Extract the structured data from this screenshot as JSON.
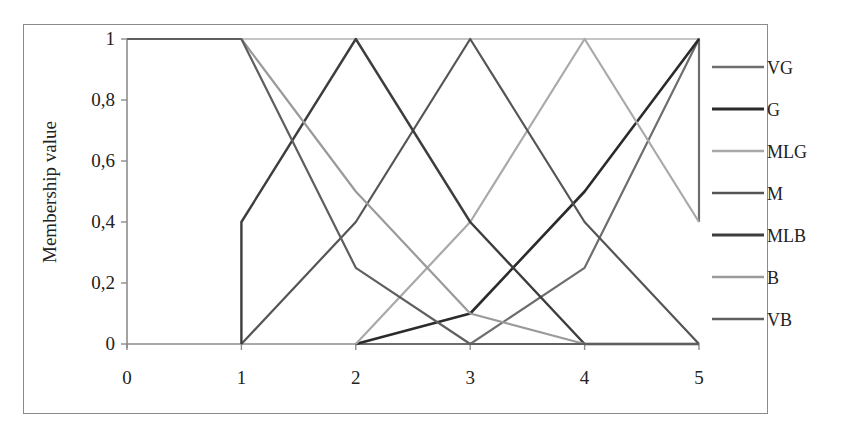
{
  "chart_data": {
    "type": "line",
    "title": "",
    "xlabel": "",
    "ylabel": "Membership value",
    "x": [
      0,
      1,
      2,
      3,
      4,
      5
    ],
    "x_tick_labels": [
      "0",
      "1",
      "2",
      "3",
      "4",
      "5"
    ],
    "y_tick_labels": [
      "0",
      "0,2",
      "0,4",
      "0,6",
      "0,8",
      "1"
    ],
    "xlim": [
      0,
      5
    ],
    "ylim": [
      0,
      1
    ],
    "grid": false,
    "legend_position": "right",
    "series": [
      {
        "name": "VG",
        "color": "#6e6e6e",
        "width": 2.2,
        "points": [
          [
            2,
            0
          ],
          [
            3,
            0
          ],
          [
            4,
            0.25
          ],
          [
            5,
            1
          ],
          [
            5,
            0.4
          ]
        ]
      },
      {
        "name": "G",
        "color": "#2b2b2b",
        "width": 2.6,
        "points": [
          [
            2,
            0
          ],
          [
            3,
            0.1
          ],
          [
            4,
            0.5
          ],
          [
            5,
            1
          ]
        ]
      },
      {
        "name": "MLG",
        "color": "#a9a9a9",
        "width": 2.2,
        "points": [
          [
            2,
            0
          ],
          [
            3,
            0.4
          ],
          [
            4,
            1
          ],
          [
            5,
            0.4
          ]
        ]
      },
      {
        "name": "M",
        "color": "#555555",
        "width": 2.2,
        "points": [
          [
            1,
            0
          ],
          [
            2,
            0.4
          ],
          [
            3,
            1
          ],
          [
            4,
            0.4
          ],
          [
            5,
            0
          ]
        ]
      },
      {
        "name": "MLB",
        "color": "#3d3d3d",
        "width": 2.4,
        "points": [
          [
            1,
            0
          ],
          [
            1,
            0.4
          ],
          [
            2,
            1
          ],
          [
            3,
            0.4
          ],
          [
            4,
            0
          ],
          [
            5,
            0
          ]
        ]
      },
      {
        "name": "B",
        "color": "#9a9a9a",
        "width": 2.2,
        "points": [
          [
            0,
            1
          ],
          [
            1,
            1
          ],
          [
            2,
            0.5
          ],
          [
            3,
            0.1
          ],
          [
            4,
            0
          ],
          [
            5,
            0
          ]
        ]
      },
      {
        "name": "VB",
        "color": "#5f5f5f",
        "width": 2.2,
        "points": [
          [
            0,
            1
          ],
          [
            1,
            1
          ],
          [
            2,
            0.25
          ],
          [
            3,
            0
          ],
          [
            4,
            0
          ],
          [
            5,
            0
          ]
        ]
      }
    ]
  },
  "legend": {
    "items": [
      {
        "label": "VG"
      },
      {
        "label": "G"
      },
      {
        "label": "MLG"
      },
      {
        "label": "M"
      },
      {
        "label": "MLB"
      },
      {
        "label": "B"
      },
      {
        "label": "VB"
      }
    ]
  }
}
